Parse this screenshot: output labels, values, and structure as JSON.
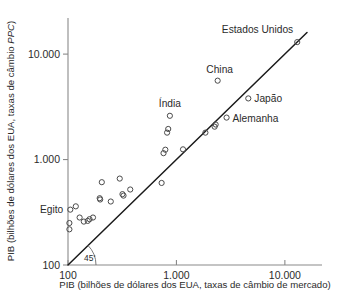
{
  "chart_data": {
    "type": "scatter",
    "title": "",
    "subtitle": "",
    "xlabel": "PIB (bilhões de dólares dos EUA, taxas de câmbio de mercado)",
    "ylabel_prefix": "PIB (bilhões de dólares dos EUA, taxas de câmbio ",
    "ylabel_italic": "PPC",
    "ylabel_suffix": ")",
    "ylabel_full": "PIB (bilhões de dólares dos EUA, taxas de câmbio PPC)",
    "xscale": "log",
    "yscale": "log",
    "xlim": [
      100,
      22000
    ],
    "ylim": [
      100,
      22000
    ],
    "xticks": [
      100,
      1000,
      10000
    ],
    "xtick_labels": [
      "100",
      "1.000",
      "10.000"
    ],
    "yticks": [
      100,
      1000,
      10000
    ],
    "ytick_labels": [
      "100",
      "1.000",
      "10.000"
    ],
    "grid": false,
    "legend": null,
    "reference_line": {
      "label": "45°",
      "degree_symbol": "°",
      "label_text": "45",
      "description": "linha de 45 graus (paridade)",
      "from": [
        100,
        100
      ],
      "to": [
        16000,
        16000
      ]
    },
    "marker": "open-circle",
    "points": [
      {
        "name": "Estados Unidos",
        "x": 13000,
        "y": 13000,
        "labeled": true,
        "label_dx": -4,
        "label_dy": -9,
        "label_anchor": "end"
      },
      {
        "name": "China",
        "x": 2400,
        "y": 5600,
        "labeled": true,
        "label_dx": 2,
        "label_dy": -8,
        "label_anchor": "middle"
      },
      {
        "name": "Japão",
        "x": 4600,
        "y": 3800,
        "labeled": true,
        "label_dx": 6,
        "label_dy": 4,
        "label_anchor": "start"
      },
      {
        "name": "Alemanha",
        "x": 2900,
        "y": 2500,
        "labeled": true,
        "label_dx": 6,
        "label_dy": 4,
        "label_anchor": "start"
      },
      {
        "name": "Índia",
        "x": 870,
        "y": 2600,
        "labeled": true,
        "label_dx": 0,
        "label_dy": -9,
        "label_anchor": "middle"
      },
      {
        "name": "Egito",
        "x": 105,
        "y": 335,
        "labeled": true,
        "label_dx": -7,
        "label_dy": 3,
        "label_anchor": "end"
      },
      {
        "name": "",
        "x": 118,
        "y": 360,
        "labeled": false
      },
      {
        "name": "",
        "x": 103,
        "y": 250,
        "labeled": false
      },
      {
        "name": "",
        "x": 103,
        "y": 218,
        "labeled": false
      },
      {
        "name": "",
        "x": 128,
        "y": 282,
        "labeled": false
      },
      {
        "name": "",
        "x": 140,
        "y": 258,
        "labeled": false
      },
      {
        "name": "",
        "x": 152,
        "y": 262,
        "labeled": false
      },
      {
        "name": "",
        "x": 158,
        "y": 272,
        "labeled": false
      },
      {
        "name": "",
        "x": 170,
        "y": 282,
        "labeled": false
      },
      {
        "name": "",
        "x": 196,
        "y": 430,
        "labeled": false
      },
      {
        "name": "",
        "x": 198,
        "y": 418,
        "labeled": false
      },
      {
        "name": "",
        "x": 205,
        "y": 610,
        "labeled": false
      },
      {
        "name": "",
        "x": 248,
        "y": 400,
        "labeled": false
      },
      {
        "name": "",
        "x": 300,
        "y": 660,
        "labeled": false
      },
      {
        "name": "",
        "x": 318,
        "y": 470,
        "labeled": false
      },
      {
        "name": "",
        "x": 325,
        "y": 455,
        "labeled": false
      },
      {
        "name": "",
        "x": 375,
        "y": 520,
        "labeled": false
      },
      {
        "name": "",
        "x": 730,
        "y": 600,
        "labeled": false
      },
      {
        "name": "",
        "x": 760,
        "y": 1150,
        "labeled": false
      },
      {
        "name": "",
        "x": 790,
        "y": 1240,
        "labeled": false
      },
      {
        "name": "",
        "x": 820,
        "y": 1800,
        "labeled": false
      },
      {
        "name": "",
        "x": 840,
        "y": 1950,
        "labeled": false
      },
      {
        "name": "",
        "x": 1150,
        "y": 1250,
        "labeled": false
      },
      {
        "name": "",
        "x": 1850,
        "y": 1800,
        "labeled": false
      },
      {
        "name": "",
        "x": 2250,
        "y": 2050,
        "labeled": false
      },
      {
        "name": "",
        "x": 2300,
        "y": 2150,
        "labeled": false
      }
    ]
  },
  "colors": {
    "axis": "#8a8a8a",
    "line": "#1a1a1a",
    "marker_stroke": "#4a4a4a",
    "text": "#2b2b2b",
    "background": "#ffffff"
  }
}
